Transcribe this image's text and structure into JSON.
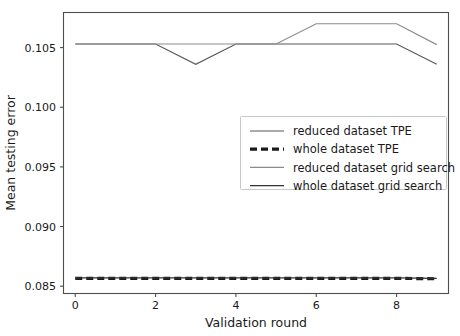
{
  "chart_data": {
    "type": "line",
    "title": "",
    "xlabel": "Validation round",
    "ylabel": "Mean testing error",
    "xlim": [
      -0.28,
      9.28
    ],
    "ylim": [
      0.08443,
      0.1079
    ],
    "xticks": [
      0,
      2,
      4,
      6,
      8
    ],
    "xticklabels": [
      "0",
      "2",
      "4",
      "6",
      "8"
    ],
    "yticks": [
      0.085,
      0.09,
      0.095,
      0.1,
      0.105
    ],
    "yticklabels": [
      "0.085",
      "0.090",
      "0.095",
      "0.100",
      "0.105"
    ],
    "grid": false,
    "legend_position": "center right",
    "x": [
      0,
      1,
      2,
      3,
      4,
      5,
      6,
      7,
      8,
      9
    ],
    "series": [
      {
        "name": "reduced dataset TPE",
        "style": "solid",
        "color": "#595959",
        "linewidth": 1.2,
        "values": [
          0.1053,
          0.1053,
          0.1053,
          0.1036,
          0.1053,
          0.1053,
          0.1053,
          0.1053,
          0.1053,
          0.1036
        ]
      },
      {
        "name": "whole dataset TPE",
        "style": "dashed",
        "color": "#1a1a1a",
        "linewidth": 3.2,
        "values": [
          0.08566,
          0.08566,
          0.08566,
          0.08566,
          0.08566,
          0.08566,
          0.08566,
          0.08566,
          0.08566,
          0.08562
        ]
      },
      {
        "name": "reduced dataset grid search",
        "style": "solid",
        "color": "#8c8c8c",
        "linewidth": 1.2,
        "values": [
          0.1053,
          0.1053,
          0.1053,
          0.1053,
          0.1053,
          0.1053,
          0.107,
          0.107,
          0.107,
          0.10525
        ]
      },
      {
        "name": "whole dataset grid search",
        "style": "solid",
        "color": "#333333",
        "linewidth": 1.4,
        "values": [
          0.0857,
          0.0857,
          0.0857,
          0.0857,
          0.0857,
          0.0857,
          0.0857,
          0.0857,
          0.0857,
          0.08566
        ]
      }
    ]
  },
  "legend": {
    "entries": [
      {
        "label": "reduced dataset TPE"
      },
      {
        "label": "whole dataset TPE"
      },
      {
        "label": "reduced dataset grid search"
      },
      {
        "label": "whole dataset grid search"
      }
    ]
  },
  "axes": {
    "x_title": "Validation round",
    "y_title": "Mean testing error"
  }
}
